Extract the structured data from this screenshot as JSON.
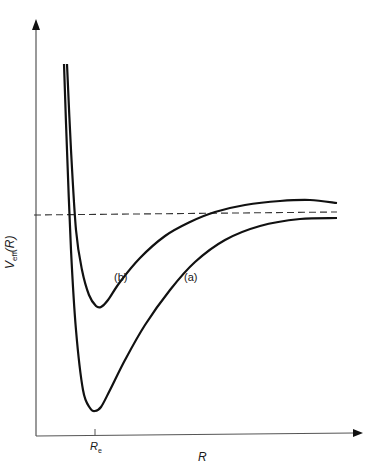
{
  "chart_data": {
    "type": "line",
    "title": "",
    "xlabel": "R",
    "ylabel": "V_eff(R)",
    "ylabel_main": "V",
    "ylabel_sub": "eff",
    "ylabel_arg": "(R)",
    "x_ticks": [
      {
        "label": "R_e",
        "main": "R",
        "sub": "e",
        "x_px": 95
      }
    ],
    "grid": false,
    "legend": "inline labels",
    "series": [
      {
        "name": "(a)",
        "label": "(a)",
        "description": "deeper potential well, minimum at R_e",
        "points_px": [
          [
            64,
            64
          ],
          [
            67,
            150
          ],
          [
            71,
            250
          ],
          [
            76,
            330
          ],
          [
            83,
            390
          ],
          [
            90,
            408
          ],
          [
            95,
            411
          ],
          [
            101,
            407
          ],
          [
            110,
            390
          ],
          [
            125,
            360
          ],
          [
            145,
            325
          ],
          [
            170,
            290
          ],
          [
            195,
            262
          ],
          [
            225,
            240
          ],
          [
            260,
            226
          ],
          [
            300,
            219
          ],
          [
            337,
            218
          ]
        ]
      },
      {
        "name": "(b)",
        "label": "(b)",
        "description": "shallower well, asymptote above dashed line",
        "points_px": [
          [
            67,
            64
          ],
          [
            71,
            150
          ],
          [
            76,
            230
          ],
          [
            82,
            270
          ],
          [
            89,
            295
          ],
          [
            96,
            306
          ],
          [
            101,
            307
          ],
          [
            108,
            300
          ],
          [
            120,
            282
          ],
          [
            140,
            258
          ],
          [
            165,
            236
          ],
          [
            190,
            222
          ],
          [
            215,
            212
          ],
          [
            245,
            205
          ],
          [
            280,
            201
          ],
          [
            310,
            200
          ],
          [
            337,
            203
          ]
        ]
      },
      {
        "name": "dissociation-level",
        "style": "dashed",
        "points_px": [
          [
            34,
            215
          ],
          [
            337,
            212
          ]
        ]
      }
    ],
    "axes_px": {
      "origin": [
        36,
        436
      ],
      "x_end": 362,
      "y_end": 20
    }
  },
  "labels": {
    "curve_a": "(a)",
    "curve_b": "(b)",
    "x_axis": "R",
    "re_main": "R",
    "re_sub": "e",
    "y_main": "V",
    "y_sub": "eff",
    "y_arg": "(R)"
  }
}
